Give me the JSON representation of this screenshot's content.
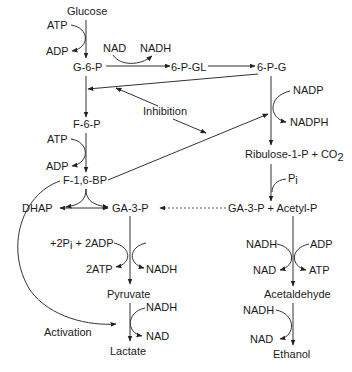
{
  "diagram": {
    "title": "",
    "nodes": {
      "glucose": "Glucose",
      "g6p": "G-6-P",
      "pgl": "6-P-GL",
      "pg": "6-P-G",
      "f6p": "F-6-P",
      "f16bp": "F-1,6-BP",
      "dhap": "DHAP",
      "ga3p": "GA-3-P",
      "pyruvate": "Pyruvate",
      "lactate": "Lactate",
      "ribulose": "Ribulose-1-P + CO",
      "ribulose_sub": "2",
      "ga3p_acetyl": "GA-3-P + Acetyl-P",
      "acetaldehyde": "Acetaldehyde",
      "ethanol": "Ethanol"
    },
    "cofactors": {
      "atp1": "ATP",
      "adp1": "ADP",
      "nad1": "NAD",
      "nadh1": "NADH",
      "nadp": "NADP",
      "nadph": "NADPH",
      "atp2": "ATP",
      "adp2": "ADP",
      "pi": "P",
      "pi_sub": "i",
      "pi2_pre": "+2P",
      "pi2_sub": "i",
      "pi2_post": " + 2ADP",
      "atp2x": "2ATP",
      "nadh_glyc": "NADH",
      "nadh_lac": "NADH",
      "nad_lac": "NAD",
      "nadh_ace": "NADH",
      "adp_ace": "ADP",
      "nad_ace": "NAD",
      "atp_ace": "ATP",
      "nadh_eth": "NADH",
      "nad_eth": "NAD"
    },
    "labels": {
      "inhibition": "Inhibition",
      "activation": "Activation"
    }
  }
}
